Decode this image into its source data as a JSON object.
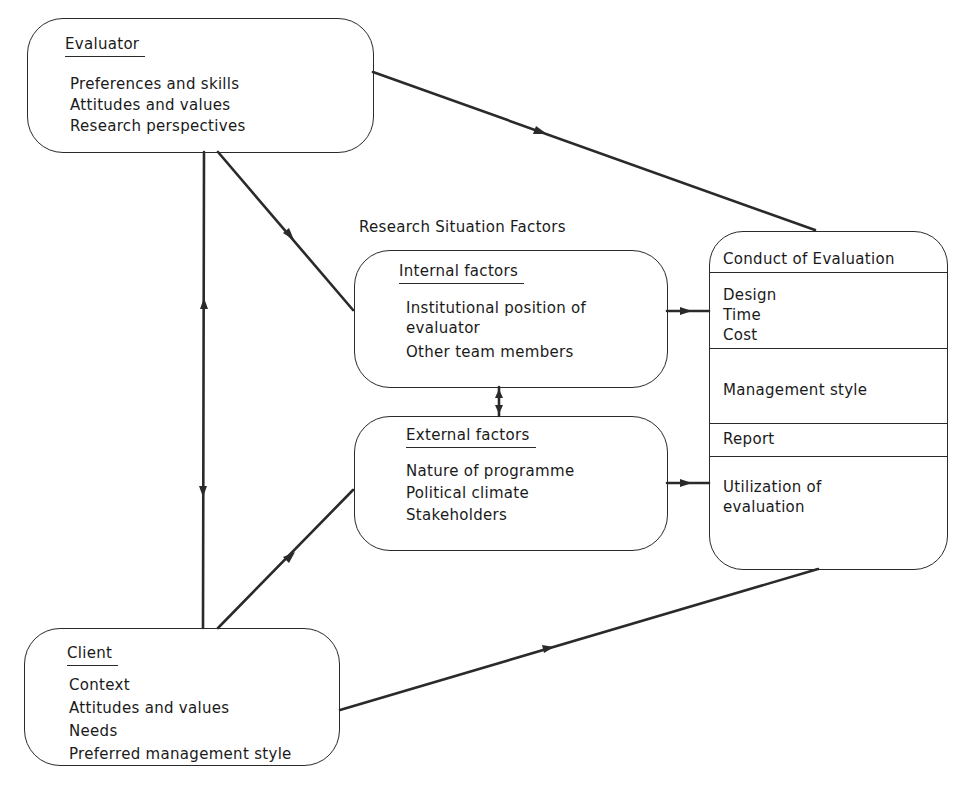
{
  "caption": "Research Situation Factors",
  "evaluator": {
    "title": "Evaluator",
    "items": [
      "Preferences and skills",
      "Attitudes and values",
      "Research perspectives"
    ]
  },
  "internal_factors": {
    "title": "Internal factors",
    "items": [
      "Institutional position of",
      "evaluator",
      "Other team members"
    ]
  },
  "external_factors": {
    "title": "External factors",
    "items": [
      "Nature of programme",
      "Political climate",
      "Stakeholders"
    ]
  },
  "conduct": {
    "title": "Conduct of Evaluation",
    "sections": [
      {
        "items": [
          "Design",
          "Time",
          "Cost"
        ]
      },
      {
        "items": [
          "Management style"
        ]
      },
      {
        "items": [
          "Report"
        ]
      },
      {
        "items": [
          "Utilization of",
          "evaluation"
        ]
      }
    ]
  },
  "client": {
    "title": "Client",
    "items": [
      "Context",
      "Attitudes and values",
      "Needs",
      "Preferred management style"
    ]
  },
  "connections": [
    {
      "from": "evaluator",
      "to": "conduct",
      "arrow": "forward"
    },
    {
      "from": "evaluator",
      "to": "internal_factors",
      "arrow": "forward"
    },
    {
      "from": "evaluator",
      "to": "client",
      "arrow": "both"
    },
    {
      "from": "client",
      "to": "external_factors",
      "arrow": "forward"
    },
    {
      "from": "client",
      "to": "conduct",
      "arrow": "forward"
    },
    {
      "from": "internal_factors",
      "to": "conduct",
      "arrow": "forward"
    },
    {
      "from": "external_factors",
      "to": "conduct",
      "arrow": "forward"
    },
    {
      "from": "internal_factors",
      "to": "external_factors",
      "arrow": "both"
    }
  ],
  "colors": {
    "line": "#2a2a2a",
    "background": "#ffffff"
  }
}
